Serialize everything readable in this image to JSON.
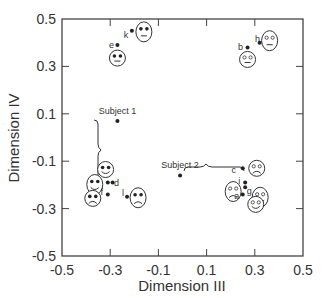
{
  "chart_data": {
    "type": "scatter",
    "title": "",
    "xlabel": "Dimension III",
    "ylabel": "Dimension IV",
    "xlim": [
      -0.5,
      0.5
    ],
    "ylim": [
      -0.5,
      0.5
    ],
    "xticks": [
      "-0.5",
      "-0.3",
      "-0.1",
      "0.1",
      "0.3",
      "0.5"
    ],
    "yticks": [
      "0.5",
      "0.3",
      "0.1",
      "-0.1",
      "-0.3",
      "-0.5"
    ],
    "grid": false,
    "points": [
      {
        "label": "k",
        "x": -0.21,
        "y": 0.45,
        "face": "neutral-tall",
        "eyes": "filled"
      },
      {
        "label": "e",
        "x": -0.27,
        "y": 0.39,
        "face": "neutral",
        "eyes": "filled"
      },
      {
        "label": "b",
        "x": 0.27,
        "y": 0.38,
        "face": "neutral",
        "eyes": "open"
      },
      {
        "label": "h",
        "x": 0.32,
        "y": 0.4,
        "face": "neutral-tall",
        "eyes": "open"
      },
      {
        "label": "Subject 1",
        "x": -0.27,
        "y": 0.07,
        "face": null
      },
      {
        "label": "d",
        "x": -0.29,
        "y": -0.19,
        "face": "smile",
        "eyes": "filled"
      },
      {
        "label": "j",
        "x": -0.31,
        "y": -0.19,
        "face": "smile-tall",
        "eyes": "filled"
      },
      {
        "label": "f",
        "x": -0.31,
        "y": -0.24,
        "face": "frown",
        "eyes": "filled"
      },
      {
        "label": "l",
        "x": -0.23,
        "y": -0.25,
        "face": "frown-tall",
        "eyes": "filled"
      },
      {
        "label": "Subject 2",
        "x": -0.01,
        "y": -0.16,
        "face": null
      },
      {
        "label": "c",
        "x": 0.25,
        "y": -0.13,
        "face": "frown",
        "eyes": "open"
      },
      {
        "label": "i",
        "x": 0.26,
        "y": -0.19,
        "face": "frown-tall",
        "eyes": "open"
      },
      {
        "label": "g",
        "x": 0.26,
        "y": -0.21,
        "face": "smile-tall",
        "eyes": "open"
      },
      {
        "label": "a",
        "x": 0.25,
        "y": -0.24,
        "face": "smile",
        "eyes": "open"
      }
    ],
    "annotations": [
      {
        "text": "Subject 1",
        "type": "brace-vertical"
      },
      {
        "text": "Subject 2",
        "type": "brace-horizontal"
      }
    ]
  }
}
